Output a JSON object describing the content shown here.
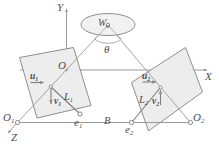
{
  "figure": {
    "background_color": "#ffffff",
    "stroke_color": "#8c8c8c",
    "plane_fill_color": "#ececec",
    "plane_fill_color_dark": "#e0e0e0",
    "label_color": "#4d4d4d",
    "marker_fill": "#ffffff"
  },
  "axes": {
    "y": {
      "label": "Y",
      "direction": "up"
    },
    "x": {
      "label": "X",
      "direction": "right"
    },
    "z": {
      "label": "Z",
      "direction": "down-left"
    },
    "origin": {
      "label": "O"
    }
  },
  "world_point": {
    "label": "W",
    "subscript": "o",
    "shape": "ellipse"
  },
  "angle": {
    "label": "θ"
  },
  "baseline": {
    "label": "B"
  },
  "left_camera": {
    "center": {
      "label": "O",
      "subscript": "1"
    },
    "epipole": {
      "label": "e",
      "subscript": "1"
    },
    "line": {
      "label": "L",
      "subscript": "1"
    },
    "axis_u": {
      "label": "u",
      "subscript": "1",
      "direction": "right"
    },
    "axis_v": {
      "label": "v",
      "subscript": "1",
      "direction": "down"
    }
  },
  "right_camera": {
    "center": {
      "label": "O",
      "subscript": "2"
    },
    "epipole": {
      "label": "e",
      "subscript": "2"
    },
    "line": {
      "label": "L",
      "subscript": "2"
    },
    "axis_u": {
      "label": "u",
      "subscript": "2",
      "direction": "right"
    },
    "axis_v": {
      "label": "v",
      "subscript": "2",
      "direction": "up"
    }
  }
}
